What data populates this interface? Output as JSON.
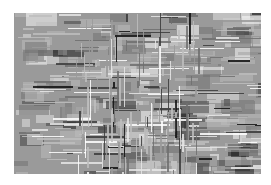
{
  "image": {
    "description": "Abstract grayscale texture of horizontal and vertical streaks radiating from center, on white background",
    "palette": [
      "#ffffff",
      "#e6e6e6",
      "#bdbdbd",
      "#9a9a9a",
      "#6e6e6e",
      "#3a3a3a",
      "#111111"
    ]
  }
}
